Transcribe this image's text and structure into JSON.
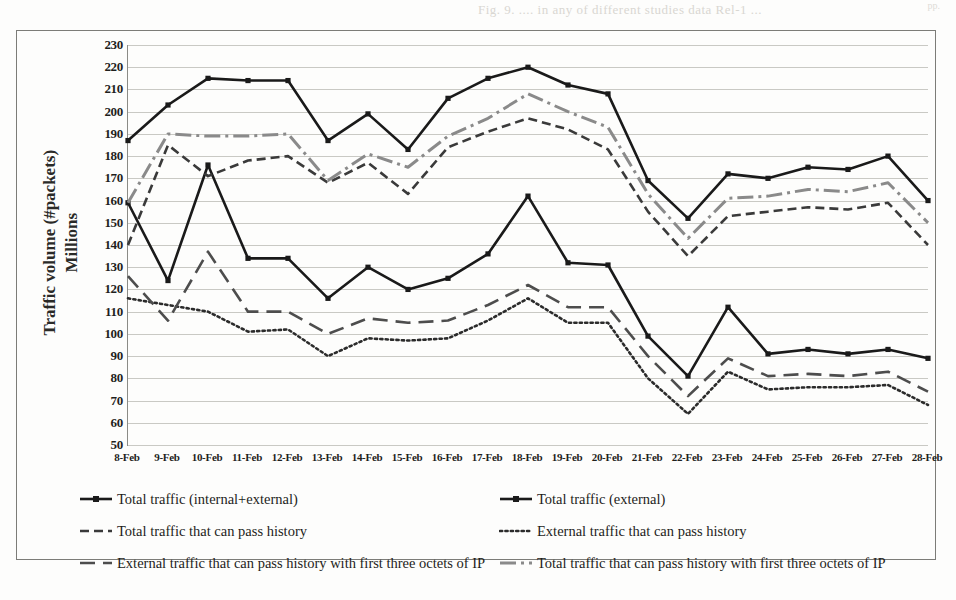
{
  "page": {
    "bleed_top_text": "Fig. 9.  ....  in  any  of  different  studies  data  Rel-1  ...",
    "bleed_right_text": "pp."
  },
  "chart_data": {
    "type": "line",
    "title": "",
    "xlabel": "",
    "ylabel": "Traffic volume (#packets)\nMillions",
    "ylim": [
      50,
      230
    ],
    "ytick_step": 10,
    "grid": true,
    "legend_position": "bottom",
    "yticks": [
      230,
      220,
      210,
      200,
      190,
      180,
      170,
      160,
      150,
      140,
      130,
      120,
      110,
      100,
      90,
      80,
      70,
      60,
      50
    ],
    "categories": [
      "8-Feb",
      "9-Feb",
      "10-Feb",
      "11-Feb",
      "12-Feb",
      "13-Feb",
      "14-Feb",
      "15-Feb",
      "16-Feb",
      "17-Feb",
      "18-Feb",
      "19-Feb",
      "20-Feb",
      "21-Feb",
      "22-Feb",
      "23-Feb",
      "24-Feb",
      "25-Feb",
      "26-Feb",
      "27-Feb",
      "28-Feb"
    ],
    "series": [
      {
        "name": "Total traffic (internal+external)",
        "style": "solid-marker",
        "color": "#1a1a1a",
        "values": [
          187,
          203,
          215,
          214,
          214,
          187,
          199,
          183,
          206,
          215,
          220,
          212,
          208,
          169,
          152,
          172,
          170,
          175,
          174,
          180,
          160
        ]
      },
      {
        "name": "Total traffic (external)",
        "style": "solid-marker",
        "color": "#1a1a1a",
        "values": [
          159,
          124,
          176,
          134,
          134,
          116,
          130,
          120,
          125,
          136,
          162,
          132,
          131,
          99,
          81,
          112,
          91,
          93,
          91,
          93,
          89
        ]
      },
      {
        "name": "Total traffic that can pass history",
        "style": "dashed",
        "color": "#3a3a3a",
        "values": [
          140,
          185,
          171,
          178,
          180,
          168,
          177,
          163,
          184,
          191,
          197,
          192,
          183,
          155,
          135,
          153,
          155,
          157,
          156,
          159,
          140
        ]
      },
      {
        "name": "External traffic that can pass history",
        "style": "dotted",
        "color": "#2b2b2b",
        "values": [
          116,
          113,
          110,
          101,
          102,
          90,
          98,
          97,
          98,
          106,
          116,
          105,
          105,
          80,
          64,
          83,
          75,
          76,
          76,
          77,
          68
        ]
      },
      {
        "name": "External traffic that can pass history with first three octets of IP",
        "style": "longdash",
        "color": "#4d4d4d",
        "values": [
          126,
          106,
          137,
          110,
          110,
          100,
          107,
          105,
          106,
          113,
          122,
          112,
          112,
          90,
          72,
          89,
          81,
          82,
          81,
          83,
          74
        ]
      },
      {
        "name": "Total traffic that can pass history with first three octets of IP",
        "style": "dashdot",
        "color": "#8a8a8a",
        "values": [
          159,
          190,
          189,
          189,
          190,
          169,
          181,
          175,
          189,
          197,
          208,
          200,
          193,
          163,
          143,
          161,
          162,
          165,
          164,
          168,
          150
        ]
      }
    ]
  },
  "legend": {
    "entries": [
      {
        "label": "Total traffic (internal+external)",
        "swatch": "solid-marker-line-icon"
      },
      {
        "label": "Total traffic (external)",
        "swatch": "solid-marker-line-icon"
      },
      {
        "label": "Total traffic that can pass history",
        "swatch": "dashed-line-icon"
      },
      {
        "label": "External traffic that can pass history",
        "swatch": "dotted-line-icon"
      },
      {
        "label": "External traffic that can pass history with first three octets of IP",
        "swatch": "longdash-line-icon"
      },
      {
        "label": "Total traffic that can pass history with first three octets of IP",
        "swatch": "gray-dash-line-icon"
      }
    ]
  }
}
